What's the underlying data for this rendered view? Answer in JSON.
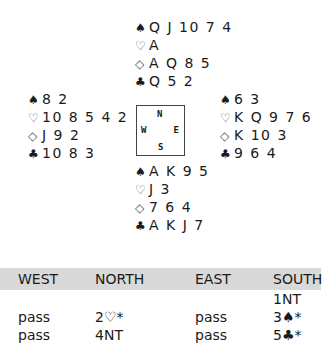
{
  "deal": {
    "north": {
      "spades": "Q J 10 7 4",
      "hearts": "A",
      "diamonds": "A Q 8 5",
      "clubs": "Q 5 2"
    },
    "west": {
      "spades": "8 2",
      "hearts": "10 8 5 4 2",
      "diamonds": "J 9 2",
      "clubs": "10 8 3"
    },
    "east": {
      "spades": "6 3",
      "hearts": "K Q 9 7 6",
      "diamonds": "K 10 3",
      "clubs": "9 6 4"
    },
    "south": {
      "spades": "A K 9 5",
      "hearts": "J 3",
      "diamonds": "7 6 4",
      "clubs": "A K J 7"
    }
  },
  "suit_symbols": {
    "spades": "♠",
    "hearts": "♡",
    "diamonds": "◇",
    "clubs": "♣"
  },
  "compass": {
    "n": "N",
    "s": "S",
    "w": "W",
    "e": "E"
  },
  "auction": {
    "headers": [
      "WEST",
      "NORTH",
      "EAST",
      "SOUTH"
    ],
    "rows": [
      [
        "",
        "",
        "",
        "1NT"
      ],
      [
        "pass",
        "2♡*",
        "pass",
        "3♠*"
      ],
      [
        "pass",
        "4NT",
        "pass",
        "5♣*"
      ]
    ]
  }
}
